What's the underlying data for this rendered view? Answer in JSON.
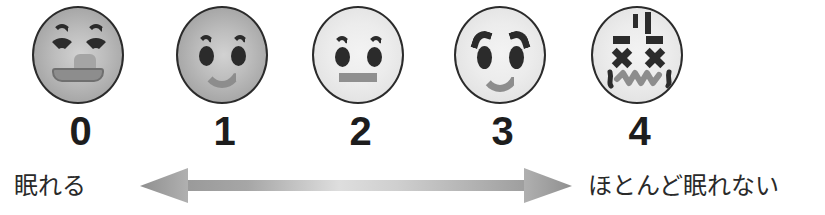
{
  "scale": {
    "type": "pictorial-rating-scale",
    "orientation": "horizontal",
    "faces": [
      {
        "value": "0",
        "icon": "happy-face-icon",
        "expression": "grinning-closed-eyes",
        "tone": "dark-gray",
        "eyes": "closed-arcs",
        "mouth": "open-smile-with-tongue"
      },
      {
        "value": "1",
        "icon": "slightly-smiling-face-icon",
        "expression": "slight-smile",
        "tone": "dark-gray",
        "eyes": "round-with-brows",
        "mouth": "small-smile"
      },
      {
        "value": "2",
        "icon": "neutral-face-icon",
        "expression": "neutral",
        "tone": "light-gray",
        "eyes": "round-with-brows",
        "mouth": "flat-bar"
      },
      {
        "value": "3",
        "icon": "worried-face-icon",
        "expression": "sad-worried",
        "tone": "light-gray",
        "eyes": "round-with-slanted-brows",
        "mouth": "frown"
      },
      {
        "value": "4",
        "icon": "dizzy-face-icon",
        "expression": "distressed-x-eyes",
        "tone": "light-gray",
        "eyes": "x-marks",
        "mouth": "wavy"
      }
    ],
    "numbers": [
      "0",
      "1",
      "2",
      "3",
      "4"
    ],
    "anchor_left": "眠れる",
    "anchor_right": "ほとんど眠れない",
    "arrow": {
      "icon": "double-headed-arrow-icon",
      "direction": "bidirectional",
      "color": "#a0a0a0",
      "highlight_color": "#d8d8d8"
    },
    "colors": {
      "ink": "#1d1d1d",
      "face_outline": "#2b2b2b",
      "face_dark_fill": "#b4b4b4",
      "face_light_fill": "#ececec",
      "feature_gray": "#8d8d8d",
      "background": "#ffffff"
    }
  }
}
